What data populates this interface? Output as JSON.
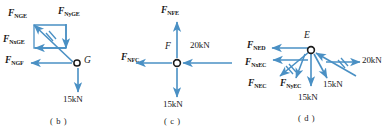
{
  "figure": {
    "colors": {
      "arrow": "#4a90c4",
      "text": "#1a1a1a",
      "node_fill": "#ffffff"
    }
  },
  "panels": [
    {
      "id": "b",
      "caption": "( b )",
      "node": "G",
      "forces": [
        {
          "name": "F_NGE",
          "sym": "F",
          "sub": "NGE",
          "dir": "up-left"
        },
        {
          "name": "F_NyGE",
          "sym": "F",
          "sub": "NyGE",
          "dir": "down"
        },
        {
          "name": "F_NxGE",
          "sym": "F",
          "sub": "NxGE",
          "dir": "left"
        },
        {
          "name": "F_NGF",
          "sym": "F",
          "sub": "NGF",
          "dir": "left"
        }
      ],
      "loads": [
        {
          "magnitude": "15kN",
          "dir": "down"
        }
      ]
    },
    {
      "id": "c",
      "caption": "( c )",
      "node": "F",
      "forces": [
        {
          "name": "F_NFE",
          "sym": "F",
          "sub": "NFE",
          "dir": "up"
        },
        {
          "name": "F_NFC",
          "sym": "F",
          "sub": "NFC",
          "dir": "left"
        }
      ],
      "loads": [
        {
          "magnitude": "20kN",
          "dir": "left"
        },
        {
          "magnitude": "15kN",
          "dir": "down"
        }
      ]
    },
    {
      "id": "d",
      "caption": "( d )",
      "node": "E",
      "forces": [
        {
          "name": "F_NED",
          "sym": "F",
          "sub": "NED",
          "dir": "left"
        },
        {
          "name": "F_NxEC",
          "sym": "F",
          "sub": "NxEC",
          "dir": "left"
        },
        {
          "name": "F_NEC",
          "sym": "F",
          "sub": "NEC",
          "dir": "down-left"
        },
        {
          "name": "F_NyEC",
          "sym": "F",
          "sub": "NyEC",
          "dir": "down"
        }
      ],
      "loads": [
        {
          "magnitude": "20kN",
          "dir": "right"
        },
        {
          "magnitude": "15kN",
          "dir": "down"
        },
        {
          "magnitude": "15kN",
          "dir": "down"
        }
      ]
    }
  ]
}
